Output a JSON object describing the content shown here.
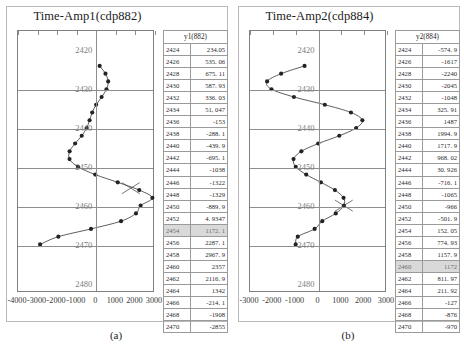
{
  "figure": {
    "panels": [
      {
        "title": "Time-Amp1(cdp882)",
        "caption": "(a)",
        "table_header": "y1(882)",
        "xaxis": {
          "ticks": [
            "-4000",
            "-3000",
            "-2000",
            "-1000",
            "0",
            "1000",
            "2000",
            "3000"
          ],
          "min": -4000,
          "max": 3000
        },
        "yaxis": {
          "ticks": [
            "2420",
            "2430",
            "2440",
            "2450",
            "2460",
            "2470",
            "2480"
          ],
          "min": 2415,
          "max": 2482
        },
        "selected_row": "2454",
        "cursor": {
          "time": 2455.5,
          "amp": 1850
        },
        "rows": [
          {
            "t": "2424",
            "v": "234.05"
          },
          {
            "t": "2426",
            "v": "535. 06"
          },
          {
            "t": "2428",
            "v": "675. 11"
          },
          {
            "t": "2430",
            "v": "587. 93"
          },
          {
            "t": "2432",
            "v": "336. 03"
          },
          {
            "t": "2434",
            "v": "51, 047"
          },
          {
            "t": "2436",
            "v": "-153"
          },
          {
            "t": "2438",
            "v": "-288. 1"
          },
          {
            "t": "2440",
            "v": "-439. 9"
          },
          {
            "t": "2442",
            "v": "-695. 1"
          },
          {
            "t": "2444",
            "v": "-1038"
          },
          {
            "t": "2446",
            "v": "-1322"
          },
          {
            "t": "2448",
            "v": "-1329"
          },
          {
            "t": "2450",
            "v": "-889. 9"
          },
          {
            "t": "2452",
            "v": "4. 9347"
          },
          {
            "t": "2454",
            "v": "1172. 1"
          },
          {
            "t": "2456",
            "v": "2287. 1"
          },
          {
            "t": "2458",
            "v": "2967. 9"
          },
          {
            "t": "2460",
            "v": "2357"
          },
          {
            "t": "2462",
            "v": "2116. 9"
          },
          {
            "t": "2464",
            "v": "1342"
          },
          {
            "t": "2466",
            "v": "-214. 1"
          },
          {
            "t": "2468",
            "v": "-1908"
          },
          {
            "t": "2470",
            "v": "-2855"
          }
        ]
      },
      {
        "title": "Time-Amp2(cdp884)",
        "caption": "(b)",
        "table_header": "y2(884)",
        "xaxis": {
          "ticks": [
            "-3000",
            "-2000",
            "-1000",
            "0",
            "1000",
            "2000",
            "3000"
          ],
          "min": -3000,
          "max": 3000
        },
        "yaxis": {
          "ticks": [
            "2420",
            "2430",
            "2440",
            "2450",
            "2460",
            "2470",
            "2480"
          ],
          "min": 2415,
          "max": 2482
        },
        "selected_row": "2460",
        "cursor": {
          "time": 2460,
          "amp": 1172
        },
        "rows": [
          {
            "t": "2424",
            "v": "-574. 9"
          },
          {
            "t": "2426",
            "v": "-1617"
          },
          {
            "t": "2428",
            "v": "-2240"
          },
          {
            "t": "2430",
            "v": "-2045"
          },
          {
            "t": "2432",
            "v": "-1048"
          },
          {
            "t": "2434",
            "v": "325. 91"
          },
          {
            "t": "2436",
            "v": "1487"
          },
          {
            "t": "2438",
            "v": "1994. 9"
          },
          {
            "t": "2440",
            "v": "1717. 9"
          },
          {
            "t": "2442",
            "v": "968. 02"
          },
          {
            "t": "2444",
            "v": "30. 926"
          },
          {
            "t": "2446",
            "v": "-716. 1"
          },
          {
            "t": "2448",
            "v": "-1065"
          },
          {
            "t": "2450",
            "v": "-966"
          },
          {
            "t": "2452",
            "v": "-501. 9"
          },
          {
            "t": "2454",
            "v": "152. 05"
          },
          {
            "t": "2456",
            "v": "774. 93"
          },
          {
            "t": "2458",
            "v": "1157. 9"
          },
          {
            "t": "2460",
            "v": "1172"
          },
          {
            "t": "2462",
            "v": "811. 97"
          },
          {
            "t": "2464",
            "v": "211. 92"
          },
          {
            "t": "2466",
            "v": "-127"
          },
          {
            "t": "2468",
            "v": "-876"
          },
          {
            "t": "2470",
            "v": "-970"
          }
        ]
      }
    ]
  },
  "chart_data": [
    {
      "type": "line",
      "title": "Time-Amp1(cdp882)",
      "xlabel": "",
      "ylabel": "",
      "xlim": [
        -4000,
        3000
      ],
      "ylim": [
        2482,
        2415
      ],
      "grid": true,
      "legend": "none",
      "x": [
        234.05,
        535.06,
        675.11,
        587.93,
        336.03,
        51.047,
        -153,
        -288.1,
        -439.9,
        -695.1,
        -1038,
        -1322,
        -1329,
        -889.9,
        4.9347,
        1172.1,
        2287.1,
        2967.9,
        2357,
        2116.9,
        1342,
        -214.1,
        -1908,
        -2855
      ],
      "y": [
        2424,
        2426,
        2428,
        2430,
        2432,
        2434,
        2436,
        2438,
        2440,
        2442,
        2444,
        2446,
        2448,
        2450,
        2452,
        2454,
        2456,
        2458,
        2460,
        2462,
        2464,
        2466,
        2468,
        2470
      ]
    },
    {
      "type": "line",
      "title": "Time-Amp2(cdp884)",
      "xlabel": "",
      "ylabel": "",
      "xlim": [
        -3000,
        3000
      ],
      "ylim": [
        2482,
        2415
      ],
      "grid": true,
      "legend": "none",
      "x": [
        -574.9,
        -1617,
        -2240,
        -2045,
        -1048,
        325.91,
        1487,
        1994.9,
        1717.9,
        968.02,
        30.926,
        -716.1,
        -1065,
        -966,
        -501.9,
        152.05,
        774.93,
        1157.9,
        1172,
        811.97,
        211.92,
        -127,
        -876,
        -970
      ],
      "y": [
        2424,
        2426,
        2428,
        2430,
        2432,
        2434,
        2436,
        2438,
        2440,
        2442,
        2444,
        2446,
        2448,
        2450,
        2452,
        2454,
        2456,
        2458,
        2460,
        2462,
        2464,
        2466,
        2468,
        2470
      ]
    }
  ]
}
